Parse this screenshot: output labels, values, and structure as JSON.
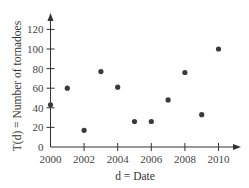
{
  "chart_data": {
    "type": "scatter",
    "title": "",
    "xlabel": "d = Date",
    "ylabel": "T(d) = Number of tornadoes",
    "x": [
      2000,
      2001,
      2002,
      2003,
      2004,
      2005,
      2006,
      2007,
      2008,
      2009,
      2010
    ],
    "y": [
      43,
      60,
      17,
      77,
      61,
      26,
      26,
      48,
      76,
      33,
      100
    ],
    "xlim": [
      2000,
      2011
    ],
    "ylim": [
      0,
      130
    ],
    "x_ticks": [
      "2000",
      "2002",
      "2004",
      "2006",
      "2008",
      "2010"
    ],
    "y_ticks": [
      "0",
      "20",
      "40",
      "60",
      "80",
      "100",
      "120"
    ],
    "grid": false,
    "legend": null,
    "point_color": "#3a3a3a",
    "axis_color": "#333333"
  }
}
